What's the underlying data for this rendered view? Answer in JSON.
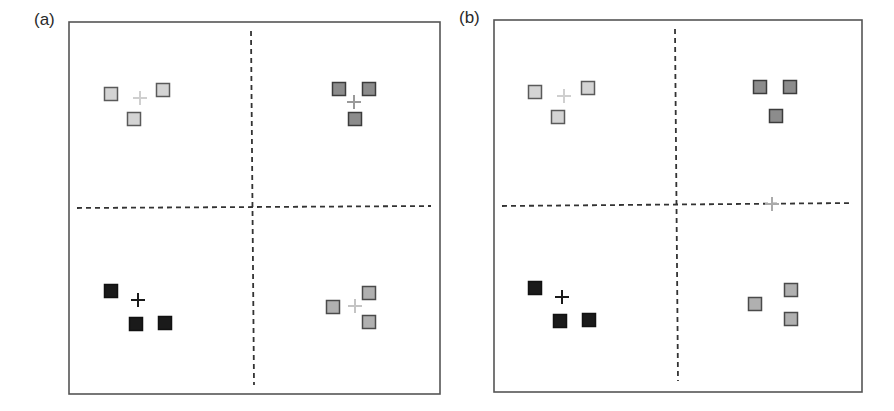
{
  "panels": [
    {
      "label": "(a)",
      "label_pos": [
        34,
        10
      ],
      "frame": {
        "x": 69,
        "y": 22,
        "w": 371,
        "h": 372
      },
      "dividers": {
        "vertical": {
          "x1": 251,
          "y1": 31,
          "x2": 254,
          "y2": 385
        },
        "horizontal": {
          "x1": 77,
          "y1": 208,
          "x2": 431,
          "y2": 206
        }
      },
      "clusters": [
        {
          "quadrant": "top-left",
          "fill": "#d4d4d4",
          "stroke": "#5a5a5a",
          "points": [
            [
              111,
              94
            ],
            [
              163,
              90
            ],
            [
              134,
              119
            ]
          ],
          "centroid": {
            "x": 140,
            "y": 98,
            "color": "#cfcfcf"
          }
        },
        {
          "quadrant": "top-right",
          "fill": "#8c8c8c",
          "stroke": "#3c3c3c",
          "points": [
            [
              339,
              89
            ],
            [
              369,
              89
            ],
            [
              355,
              119
            ]
          ],
          "centroid": {
            "x": 354,
            "y": 102,
            "color": "#9a9a9a"
          }
        },
        {
          "quadrant": "bottom-left",
          "fill": "#1a1a1a",
          "stroke": "#111111",
          "points": [
            [
              111,
              291
            ],
            [
              136,
              324
            ],
            [
              165,
              323
            ]
          ],
          "centroid": {
            "x": 138,
            "y": 300,
            "color": "#1a1a1a"
          }
        },
        {
          "quadrant": "bottom-right",
          "fill": "#b0b0b0",
          "stroke": "#4a4a4a",
          "points": [
            [
              333,
              307
            ],
            [
              369,
              293
            ],
            [
              369,
              322
            ]
          ],
          "centroid": {
            "x": 355,
            "y": 306,
            "color": "#c4c4c4"
          }
        }
      ]
    },
    {
      "label": "(b)",
      "label_pos": [
        459,
        8
      ],
      "frame": {
        "x": 494,
        "y": 20,
        "w": 368,
        "h": 372
      },
      "dividers": {
        "vertical": {
          "x1": 675,
          "y1": 29,
          "x2": 678,
          "y2": 381
        },
        "horizontal": {
          "x1": 502,
          "y1": 206,
          "x2": 853,
          "y2": 203
        }
      },
      "clusters": [
        {
          "quadrant": "top-left",
          "fill": "#d4d4d4",
          "stroke": "#5a5a5a",
          "points": [
            [
              535,
              92
            ],
            [
              588,
              88
            ],
            [
              558,
              117
            ]
          ],
          "centroid": {
            "x": 564,
            "y": 96,
            "color": "#cfcfcf"
          }
        },
        {
          "quadrant": "top-right",
          "fill": "#8c8c8c",
          "stroke": "#3c3c3c",
          "points": [
            [
              760,
              87
            ],
            [
              790,
              87
            ],
            [
              776,
              116
            ]
          ],
          "centroid": {
            "x": 772,
            "y": 204,
            "color": "#aaaaaa"
          }
        },
        {
          "quadrant": "bottom-left",
          "fill": "#1a1a1a",
          "stroke": "#111111",
          "points": [
            [
              535,
              288
            ],
            [
              560,
              321
            ],
            [
              589,
              320
            ]
          ],
          "centroid": {
            "x": 562,
            "y": 297,
            "color": "#1a1a1a"
          }
        },
        {
          "quadrant": "bottom-right",
          "fill": "#b0b0b0",
          "stroke": "#4a4a4a",
          "points": [
            [
              755,
              304
            ],
            [
              791,
              290
            ],
            [
              791,
              319
            ]
          ],
          "centroid": null
        }
      ]
    }
  ],
  "style": {
    "frame_color": "#555555",
    "divider_color": "#333333",
    "square_size": 13
  }
}
